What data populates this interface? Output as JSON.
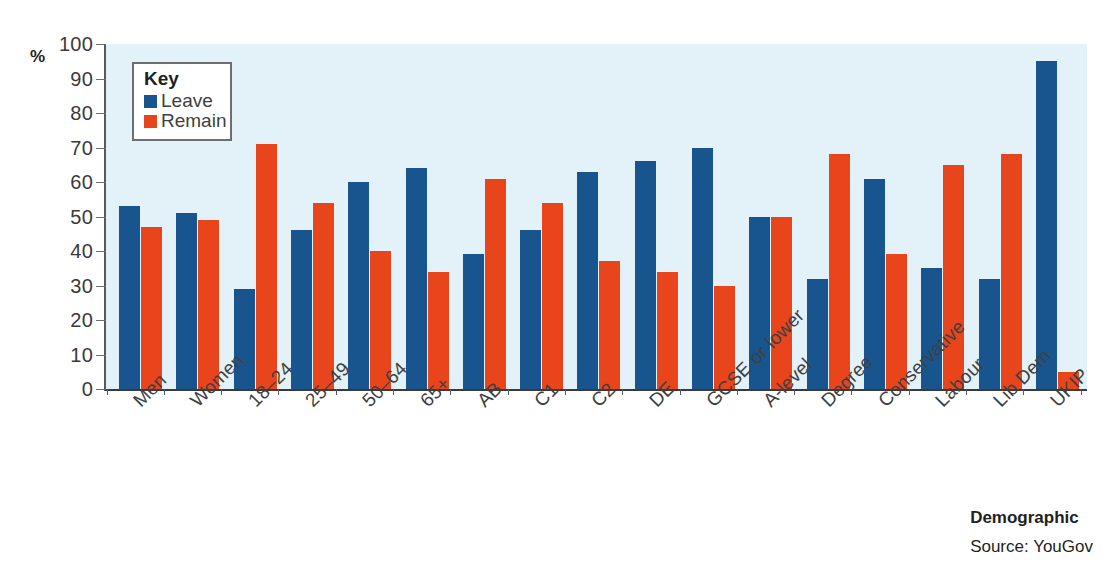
{
  "chart_data": {
    "type": "bar",
    "title": "",
    "subtitle": "",
    "xlabel": "Demographic",
    "ylabel": "%",
    "ylim": [
      0,
      100
    ],
    "ytick_step": 10,
    "yticks": [
      100,
      90,
      80,
      70,
      60,
      50,
      40,
      30,
      20,
      10,
      0
    ],
    "grid": false,
    "legend_position": "top-left",
    "legend_title": "Key",
    "categories": [
      "Men",
      "Women",
      "18–24",
      "25–49",
      "50–64",
      "65+",
      "AB",
      "C1",
      "C2",
      "DE",
      "GCSE or lower",
      "A-level",
      "Degree",
      "Conservative",
      "Labour",
      "Lib Dem",
      "UKIP"
    ],
    "series": [
      {
        "name": "Leave",
        "color": "#18558f",
        "values": [
          53,
          51,
          29,
          46,
          60,
          64,
          39,
          46,
          63,
          66,
          70,
          50,
          32,
          61,
          35,
          32,
          95
        ]
      },
      {
        "name": "Remain",
        "color": "#e8451c",
        "values": [
          47,
          49,
          71,
          54,
          40,
          34,
          61,
          54,
          37,
          34,
          30,
          50,
          68,
          39,
          65,
          68,
          5
        ]
      }
    ],
    "source": "Source: YouGov",
    "plot_background": "#e2f2f8"
  },
  "footer": {
    "axis_title": "Demographic",
    "source": "Source: YouGov"
  }
}
